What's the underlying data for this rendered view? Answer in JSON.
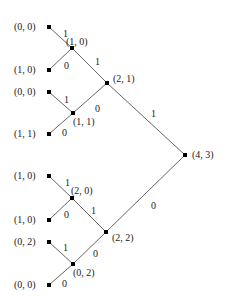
{
  "diagram": {
    "type": "binary-tree",
    "edge_color": "#666666",
    "node_color": "#000000",
    "nodes": [
      {
        "id": "root",
        "label": "(4, 3)",
        "x": 185,
        "y": 155,
        "lx": 192,
        "ly": 150
      },
      {
        "id": "n21",
        "label": "(2, 1)",
        "x": 107,
        "y": 83,
        "lx": 113,
        "ly": 74
      },
      {
        "id": "n22",
        "label": "(2, 2)",
        "x": 106,
        "y": 232,
        "lx": 112,
        "ly": 233
      },
      {
        "id": "n10",
        "label": "(1, 0)",
        "x": 72,
        "y": 48,
        "lx": 66,
        "ly": 37
      },
      {
        "id": "n11",
        "label": "(1, 1)",
        "x": 73,
        "y": 113,
        "lx": 73,
        "ly": 117
      },
      {
        "id": "n20",
        "label": "(2, 0)",
        "x": 72,
        "y": 198,
        "lx": 71,
        "ly": 186
      },
      {
        "id": "n02",
        "label": "(0, 2)",
        "x": 73,
        "y": 264,
        "lx": 73,
        "ly": 268
      },
      {
        "id": "l1",
        "label": "(0, 0)",
        "x": 49,
        "y": 27,
        "lx": 14,
        "ly": 22
      },
      {
        "id": "l2",
        "label": "(1, 0)",
        "x": 49,
        "y": 70,
        "lx": 14,
        "ly": 65
      },
      {
        "id": "l3",
        "label": "(0, 0)",
        "x": 49,
        "y": 92,
        "lx": 14,
        "ly": 87
      },
      {
        "id": "l4",
        "label": "(1, 1)",
        "x": 49,
        "y": 134,
        "lx": 14,
        "ly": 129
      },
      {
        "id": "l5",
        "label": "(1, 0)",
        "x": 49,
        "y": 176,
        "lx": 14,
        "ly": 171
      },
      {
        "id": "l6",
        "label": "(1, 0)",
        "x": 49,
        "y": 220,
        "lx": 14,
        "ly": 215
      },
      {
        "id": "l7",
        "label": "(0, 2)",
        "x": 49,
        "y": 242,
        "lx": 14,
        "ly": 237
      },
      {
        "id": "l8",
        "label": "(0, 0)",
        "x": 49,
        "y": 285,
        "lx": 14,
        "ly": 280
      }
    ],
    "edges": [
      {
        "from": "root",
        "to": "n21",
        "label": "1",
        "lx": 151,
        "ly": 109
      },
      {
        "from": "root",
        "to": "n22",
        "label": "0",
        "lx": 151,
        "ly": 201
      },
      {
        "from": "n21",
        "to": "n10",
        "label": "1",
        "lx": 95,
        "ly": 57
      },
      {
        "from": "n21",
        "to": "n11",
        "label": "0",
        "lx": 95,
        "ly": 104
      },
      {
        "from": "n22",
        "to": "n20",
        "label": "1",
        "lx": 91,
        "ly": 206
      },
      {
        "from": "n22",
        "to": "n02",
        "label": "0",
        "lx": 93,
        "ly": 249
      },
      {
        "from": "n10",
        "to": "l1",
        "label": "1",
        "lx": 63,
        "ly": 29
      },
      {
        "from": "n10",
        "to": "l2",
        "label": "0",
        "lx": 64,
        "ly": 61
      },
      {
        "from": "n11",
        "to": "l3",
        "label": "1",
        "lx": 64,
        "ly": 95
      },
      {
        "from": "n11",
        "to": "l4",
        "label": "0",
        "lx": 62,
        "ly": 128
      },
      {
        "from": "n20",
        "to": "l5",
        "label": "1",
        "lx": 65,
        "ly": 178
      },
      {
        "from": "n20",
        "to": "l6",
        "label": "0",
        "lx": 64,
        "ly": 210
      },
      {
        "from": "n02",
        "to": "l7",
        "label": "1",
        "lx": 63,
        "ly": 243
      },
      {
        "from": "n02",
        "to": "l8",
        "label": "0",
        "lx": 62,
        "ly": 279
      }
    ]
  }
}
